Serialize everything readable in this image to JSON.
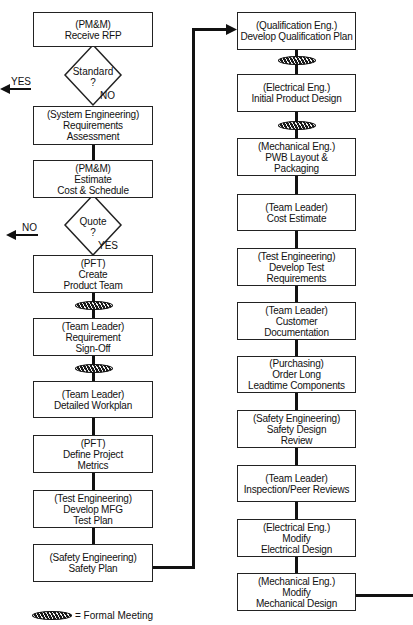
{
  "legend": {
    "symbol": "formal-meeting-icon",
    "label": "= Formal Meeting"
  },
  "left_column": {
    "receive_rfp": {
      "role": "(PM&M)",
      "lines": [
        "Receive RFP"
      ]
    },
    "standard_decision": {
      "question": "Standard",
      "mark": "?",
      "yes_label": "YES",
      "no_label": "NO"
    },
    "requirements_assessment": {
      "role": "(System Engineering)",
      "lines": [
        "Requirements",
        "Assessment"
      ]
    },
    "estimate": {
      "role": "(PM&M)",
      "lines": [
        "Estimate",
        "Cost & Schedule"
      ]
    },
    "quote_decision": {
      "question": "Quote",
      "mark": "?",
      "yes_label": "YES",
      "no_label": "NO"
    },
    "create_team": {
      "role": "(PFT)",
      "lines": [
        "Create",
        "Product Team"
      ]
    },
    "requirement_signoff": {
      "role": "(Team Leader)",
      "lines": [
        "Requirement",
        "Sign-Off"
      ]
    },
    "detailed_workplan": {
      "role": "(Team Leader)",
      "lines": [
        "Detailed Workplan"
      ]
    },
    "project_metrics": {
      "role": "(PFT)",
      "lines": [
        "Define Project",
        "Metrics"
      ]
    },
    "mfg_test_plan": {
      "role": "(Test Engineering)",
      "lines": [
        "Develop MFG",
        "Test Plan"
      ]
    },
    "safety_plan": {
      "role": "(Safety Engineering)",
      "lines": [
        "Safety Plan"
      ]
    }
  },
  "right_column": {
    "qualification_plan": {
      "role": "(Qualification Eng.)",
      "lines": [
        "Develop Qualification Plan"
      ]
    },
    "initial_design": {
      "role": "(Electrical Eng.)",
      "lines": [
        "Initial Product Design"
      ]
    },
    "pwb_layout": {
      "role": "(Mechanical Eng.)",
      "lines": [
        "PWB Layout &",
        "Packaging"
      ]
    },
    "cost_estimate": {
      "role": "(Team Leader)",
      "lines": [
        "Cost Estimate"
      ]
    },
    "test_requirements": {
      "role": "(Test Engineering)",
      "lines": [
        "Develop Test",
        "Requirements"
      ]
    },
    "customer_documentation": {
      "role": "(Team Leader)",
      "lines": [
        "Customer",
        "Documentation"
      ]
    },
    "order_components": {
      "role": "(Purchasing)",
      "lines": [
        "Order Long",
        "Leadtime Components"
      ]
    },
    "safety_review": {
      "role": "(Safety Engineering)",
      "lines": [
        "Safety Design",
        "Review"
      ]
    },
    "peer_reviews": {
      "role": "(Team Leader)",
      "lines": [
        "Inspection/Peer Reviews"
      ]
    },
    "modify_electrical": {
      "role": "(Electrical Eng.)",
      "lines": [
        "Modify",
        "Electrical Design"
      ]
    },
    "modify_mechanical": {
      "role": "(Mechanical Eng.)",
      "lines": [
        "Modify",
        "Mechanical Design"
      ]
    }
  }
}
